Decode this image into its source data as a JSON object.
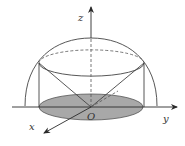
{
  "figure": {
    "labels": {
      "z_axis": "z",
      "y_axis": "y",
      "x_axis": "x",
      "origin": "O"
    },
    "colors": {
      "stroke": "#3a3a3a",
      "shade": "#a8a8a8",
      "background": "#ffffff"
    }
  }
}
